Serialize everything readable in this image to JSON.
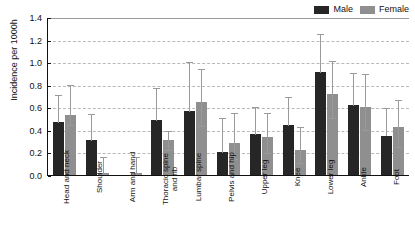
{
  "chart_data": {
    "type": "bar",
    "title": "",
    "xlabel": "",
    "ylabel": "Incidence per 1000h",
    "ylim": [
      0.0,
      1.4
    ],
    "yticks": [
      "0.0",
      "0.2",
      "0.4",
      "0.6",
      "0.8",
      "1.0",
      "1.2",
      "1.4"
    ],
    "grid": true,
    "legend_position": "top-right",
    "categories": [
      "Head and neck",
      "Shoulder",
      "Arm and hand",
      "Thoracic spine and rib",
      "Lumbar spine",
      "Pelvis and hip",
      "Upper leg",
      "Knee",
      "Lower leg",
      "Ankle",
      "Foot"
    ],
    "series": [
      {
        "name": "Male",
        "color": "#262626",
        "values": [
          0.47,
          0.31,
          0.0,
          0.49,
          0.57,
          0.2,
          0.36,
          0.44,
          0.91,
          0.62,
          0.35
        ],
        "err_low": [
          0.47,
          0.31,
          0.0,
          0.49,
          0.57,
          0.2,
          0.36,
          0.44,
          0.91,
          0.62,
          0.35
        ],
        "err_high": [
          0.72,
          0.55,
          0.0,
          0.78,
          1.01,
          0.51,
          0.61,
          0.7,
          1.26,
          0.91,
          0.6
        ]
      },
      {
        "name": "Female",
        "color": "#8f8f8f",
        "values": [
          0.53,
          0.015,
          0.015,
          0.31,
          0.65,
          0.285,
          0.335,
          0.22,
          0.715,
          0.6,
          0.425
        ],
        "err_low": [
          0.45,
          0.015,
          0.015,
          0.23,
          0.44,
          0.155,
          0.205,
          0.115,
          0.51,
          0.41,
          0.26
        ],
        "err_high": [
          0.81,
          0.17,
          0.17,
          0.4,
          0.95,
          0.56,
          0.56,
          0.43,
          1.02,
          0.9,
          0.67
        ]
      }
    ]
  },
  "legend": {
    "items": [
      {
        "label": "Male",
        "color": "#262626"
      },
      {
        "label": "Female",
        "color": "#8f8f8f"
      }
    ]
  },
  "axes": {
    "y_title": "Incidence per 1000h"
  }
}
